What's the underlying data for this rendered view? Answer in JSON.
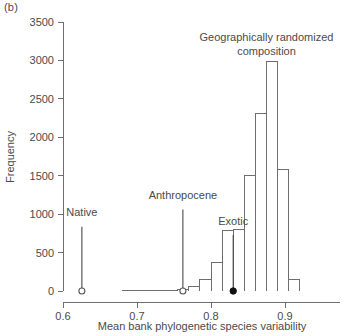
{
  "panel": {
    "label": "(b)"
  },
  "chart_data": {
    "type": "bar",
    "title": "",
    "subtitle": "",
    "xlabel": "Mean bank phylogenetic species variability",
    "ylabel": "Frequency",
    "xlim": [
      0.585,
      0.945
    ],
    "ylim": [
      0,
      3500
    ],
    "xticks": [
      0.6,
      0.7,
      0.8,
      0.9
    ],
    "xtick_labels": [
      "0.6",
      "0.7",
      "0.8",
      "0.9"
    ],
    "yticks": [
      0,
      500,
      1000,
      1500,
      2000,
      2500,
      3000,
      3500
    ],
    "ytick_labels": [
      "0",
      "500",
      "1000",
      "1500",
      "2000",
      "2500",
      "3000",
      "3500"
    ],
    "grid": false,
    "legend_position": "none",
    "bin_width": 0.015,
    "bins": [
      {
        "x0": 0.68,
        "x1": 0.695,
        "value": 5
      },
      {
        "x0": 0.695,
        "x1": 0.71,
        "value": 5
      },
      {
        "x0": 0.71,
        "x1": 0.725,
        "value": 8
      },
      {
        "x0": 0.725,
        "x1": 0.74,
        "value": 10
      },
      {
        "x0": 0.74,
        "x1": 0.755,
        "value": 12
      },
      {
        "x0": 0.755,
        "x1": 0.77,
        "value": 15
      },
      {
        "x0": 0.77,
        "x1": 0.785,
        "value": 55
      },
      {
        "x0": 0.785,
        "x1": 0.8,
        "value": 150
      },
      {
        "x0": 0.8,
        "x1": 0.815,
        "value": 375
      },
      {
        "x0": 0.815,
        "x1": 0.83,
        "value": 790
      },
      {
        "x0": 0.83,
        "x1": 0.845,
        "value": 800
      },
      {
        "x0": 0.845,
        "x1": 0.86,
        "value": 1505
      },
      {
        "x0": 0.86,
        "x1": 0.875,
        "value": 2315
      },
      {
        "x0": 0.875,
        "x1": 0.89,
        "value": 2990
      },
      {
        "x0": 0.89,
        "x1": 0.905,
        "value": 1585
      },
      {
        "x0": 0.905,
        "x1": 0.92,
        "value": 150
      }
    ],
    "annotations": [
      {
        "name": "native",
        "label": "Native",
        "x": 0.6255,
        "y": 0,
        "marker": "open-circle",
        "label_y": 975,
        "stem_top": 835
      },
      {
        "name": "anthropocene",
        "label": "Anthropocene",
        "x": 0.762,
        "y": 0,
        "marker": "open-circle",
        "label_y": 1200,
        "stem_top": 1060
      },
      {
        "name": "exotic",
        "label": "Exotic",
        "x": 0.83,
        "y": 0,
        "marker": "filled-circle",
        "label_y": 855,
        "stem_top": 730
      },
      {
        "name": "distribution-caption",
        "label_line1": "Geographically randomized",
        "label_line2": "composition",
        "x": 0.875,
        "y": 3250
      }
    ]
  }
}
